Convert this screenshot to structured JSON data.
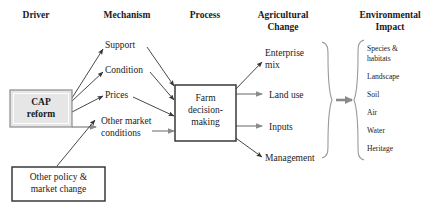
{
  "diagram": {
    "colors": {
      "text": "#1a1a1a",
      "arrow": "#333333",
      "arrow_gray": "#8a8a8a",
      "brace": "#9a9a9a",
      "shaded_box_fill": "#e6e6e6",
      "shaded_box_stroke": "#8c8c8c",
      "plain_box_stroke": "#2b2b2b",
      "background": "#ffffff"
    },
    "headers": [
      {
        "id": "driver",
        "label": "Driver"
      },
      {
        "id": "mechanism",
        "label": "Mechanism"
      },
      {
        "id": "process",
        "label": "Process"
      },
      {
        "id": "agricultural-change",
        "label_line1": "Agricultural",
        "label_line2": "Change"
      },
      {
        "id": "environmental-impact",
        "label_line1": "Environmental",
        "label_line2": "Impact"
      }
    ],
    "driver": {
      "cap_box": {
        "line1": "CAP",
        "line2": "reform"
      },
      "other_box": {
        "line1": "Other policy &",
        "line2": "market change"
      }
    },
    "mechanism": {
      "items": [
        {
          "id": "support",
          "label": "Support"
        },
        {
          "id": "condition",
          "label": "Condition"
        },
        {
          "id": "prices",
          "label": "Prices"
        },
        {
          "id": "other-market-conditions",
          "label_line1": "Other market",
          "label_line2": "conditions"
        }
      ]
    },
    "process": {
      "farm_box": {
        "line1": "Farm",
        "line2": "decision-",
        "line3": "making"
      }
    },
    "agricultural_change": {
      "items": [
        {
          "id": "enterprise-mix",
          "label_line1": "Enterprise",
          "label_line2": "mix"
        },
        {
          "id": "land-use",
          "label": "Land use"
        },
        {
          "id": "inputs",
          "label": "Inputs"
        },
        {
          "id": "management",
          "label": "Management"
        }
      ]
    },
    "environmental_impact": {
      "items": [
        {
          "id": "species-habitats",
          "label_line1": "Species &",
          "label_line2": "habitats"
        },
        {
          "id": "landscape",
          "label": "Landscape"
        },
        {
          "id": "soil",
          "label": "Soil"
        },
        {
          "id": "air",
          "label": "Air"
        },
        {
          "id": "water",
          "label": "Water"
        },
        {
          "id": "heritage",
          "label": "Heritage"
        }
      ]
    }
  }
}
